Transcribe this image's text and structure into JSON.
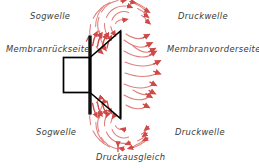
{
  "diagram": {
    "background_color": "#ffffff",
    "line_color": "#000000",
    "wave_color": "#d9534f",
    "wave_color_light": "#e8928f",
    "label_color": "#3a3a3a",
    "labels": {
      "sogwelle_top": "Sogwelle",
      "druckwelle_top": "Druckwelle",
      "membranrueckseite": "Membranrückseite",
      "membranvorderseite": "Membranvorderseite",
      "sogwelle_bottom": "Sogwelle",
      "druckwelle_bottom": "Druckwelle",
      "druckausgleich": "Druckausgleich"
    },
    "parts": {
      "magnet_body": "speaker-magnet-body",
      "membrane_bar": "speaker-membrane-bar",
      "cone": "speaker-cone"
    },
    "wave_groups": {
      "front_pressure": "front-pressure-wave-arrows",
      "top_rear_suction": "top-suction-wave-arcs",
      "bottom_rear_suction": "bottom-suction-wave-arcs",
      "pressure_equalization": "pressure-equalization-arrows"
    }
  }
}
